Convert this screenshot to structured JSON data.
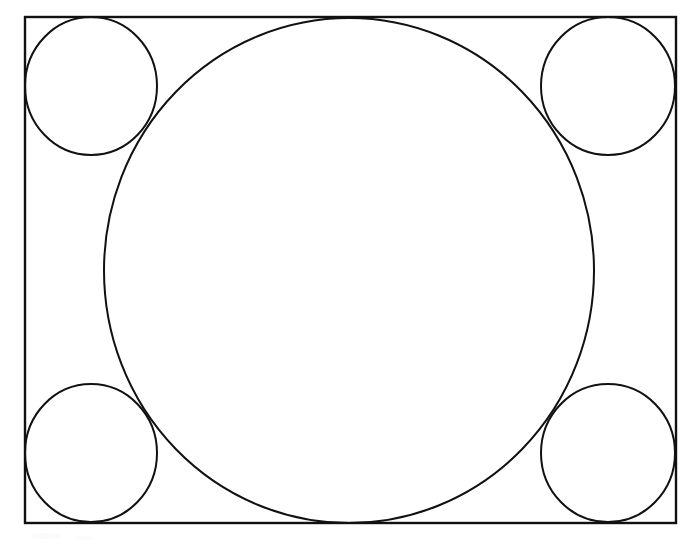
{
  "figure": {
    "title": "Geometric line drawing: large circle inscribed in rectangle with four tangent corner circles",
    "background_color": "#ffffff",
    "stroke_color": "#111111",
    "canvas": {
      "width": 692,
      "height": 544
    },
    "frame": {
      "name": "bounding-rectangle",
      "x": 25,
      "y": 17,
      "width": 651,
      "height": 506,
      "stroke_width": 2.4,
      "fill": "none"
    },
    "central_circle": {
      "name": "central-inscribed-circle",
      "cx": 349,
      "cy": 270.5,
      "rx": 245,
      "ry": 252.5,
      "stroke_width": 2,
      "fill": "none",
      "tangency": "top and bottom edges of rectangle"
    },
    "corner_circles": [
      {
        "name": "corner-circle-top-left",
        "position": "top-left",
        "cx": 91,
        "cy": 86,
        "rx": 66,
        "ry": 69,
        "stroke_width": 2,
        "fill": "none"
      },
      {
        "name": "corner-circle-top-right",
        "position": "top-right",
        "cx": 608,
        "cy": 86,
        "rx": 67,
        "ry": 69,
        "stroke_width": 2,
        "fill": "none"
      },
      {
        "name": "corner-circle-bottom-left",
        "position": "bottom-left",
        "cx": 91,
        "cy": 453,
        "rx": 66,
        "ry": 69,
        "stroke_width": 2,
        "fill": "none"
      },
      {
        "name": "corner-circle-bottom-right",
        "position": "bottom-right",
        "cx": 608,
        "cy": 453,
        "rx": 67,
        "ry": 69,
        "stroke_width": 2,
        "fill": "none"
      }
    ],
    "artifacts": [
      {
        "name": "scan-speck-1",
        "cx": 46,
        "cy": 536,
        "rx": 16,
        "ry": 3
      },
      {
        "name": "scan-speck-2",
        "cx": 86,
        "cy": 538,
        "rx": 9,
        "ry": 2
      }
    ]
  }
}
